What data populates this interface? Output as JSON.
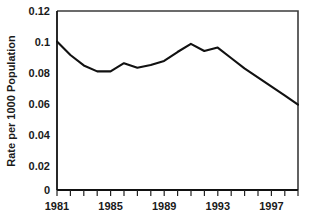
{
  "chart_data": {
    "type": "line",
    "title": "",
    "subtitle": "",
    "xlabel": "",
    "ylabel": "Rate per 1000 Population",
    "xlim": [
      1981,
      1999
    ],
    "ylim": [
      0,
      0.12
    ],
    "grid": false,
    "legend": null,
    "y_ticks": [
      0,
      0.02,
      0.04,
      0.06,
      0.08,
      0.1,
      0.12
    ],
    "y_tick_labels": [
      "0",
      "0.02",
      "0.04",
      "0.06",
      "0.08",
      "0.1",
      "0.12"
    ],
    "x_ticks": [
      1981,
      1982,
      1983,
      1984,
      1985,
      1986,
      1987,
      1988,
      1989,
      1990,
      1991,
      1992,
      1993,
      1994,
      1995,
      1996,
      1997,
      1998,
      1999
    ],
    "x_tick_labels_shown": [
      "1981",
      "1985",
      "1989",
      "1993",
      "1997"
    ],
    "x_labeled_ticks": [
      1981,
      1985,
      1989,
      1993,
      1997
    ],
    "line_color": "#111111",
    "series": [
      {
        "name": "Rate per 1000 Population",
        "x": [
          1981,
          1982,
          1983,
          1984,
          1985,
          1986,
          1987,
          1988,
          1989,
          1990,
          1991,
          1992,
          1993,
          1994,
          1995,
          1996,
          1997,
          1998,
          1999
        ],
        "values": [
          0.0995,
          0.0905,
          0.0835,
          0.0795,
          0.0795,
          0.085,
          0.082,
          0.0838,
          0.0865,
          0.0925,
          0.098,
          0.0932,
          0.0955,
          0.0885,
          0.0815,
          0.0755,
          0.0695,
          0.0635,
          0.0572
        ]
      }
    ]
  },
  "axis": {
    "y_title": "Rate per 1000 Population"
  }
}
